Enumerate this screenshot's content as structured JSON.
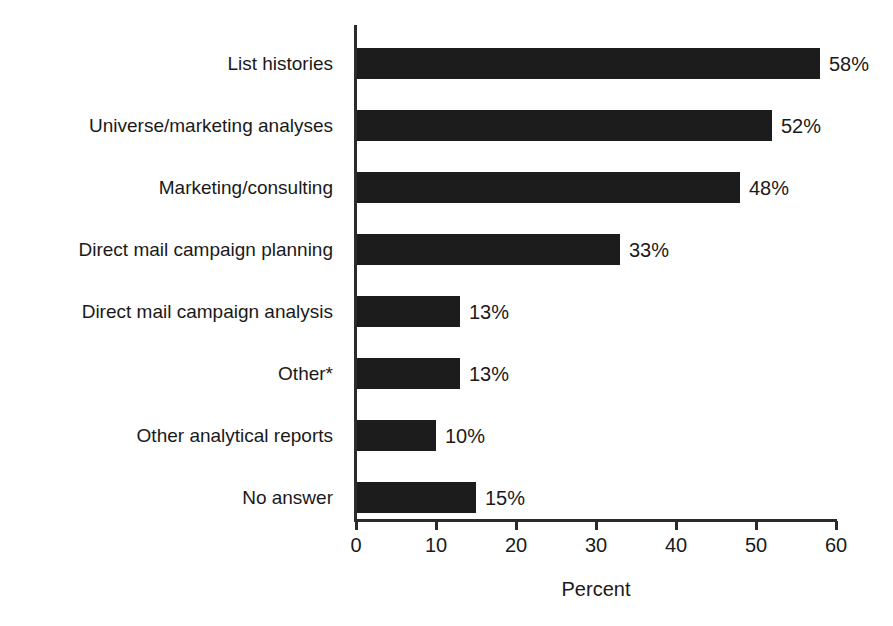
{
  "chart_data": {
    "type": "bar",
    "orientation": "horizontal",
    "title": "",
    "xlabel": "Percent",
    "ylabel": "",
    "xlim": [
      0,
      60
    ],
    "xticks": [
      0,
      10,
      20,
      30,
      40,
      50,
      60
    ],
    "xtick_labels": [
      "0",
      "10",
      "20",
      "30",
      "40",
      "50",
      "60"
    ],
    "grid": false,
    "legend": false,
    "bar_color": "#1c1c1c",
    "background_color": "#ffffff",
    "categories": [
      "List histories",
      "Universe/marketing analyses",
      "Marketing/consulting",
      "Direct mail campaign planning",
      "Direct mail campaign analysis",
      "Other*",
      "Other analytical reports",
      "No answer"
    ],
    "values": [
      58,
      52,
      48,
      33,
      13,
      13,
      10,
      15
    ],
    "value_labels": [
      "58%",
      "52%",
      "48%",
      "33%",
      "13%",
      "13%",
      "10%",
      "15%"
    ]
  }
}
